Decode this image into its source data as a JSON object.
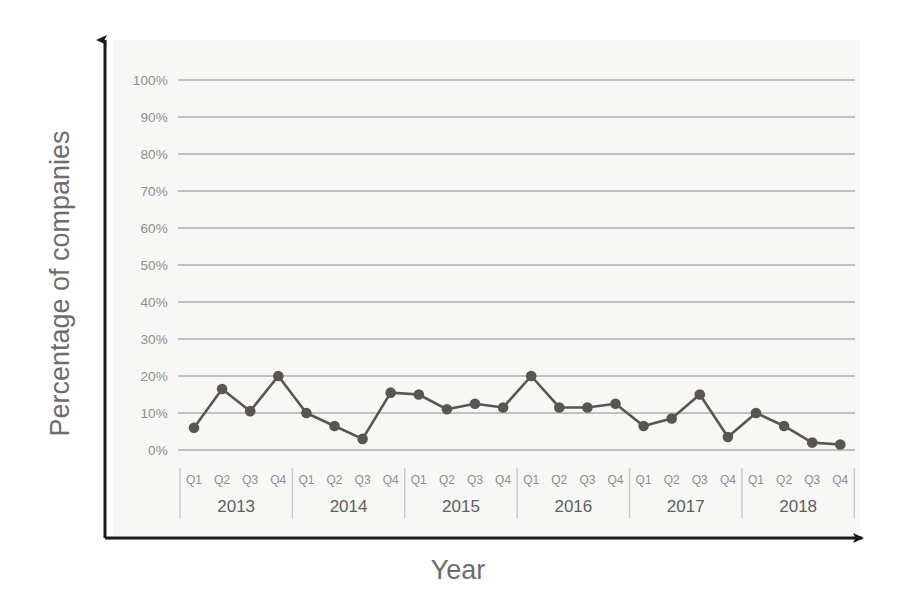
{
  "chart_data": {
    "type": "line",
    "title": "",
    "xlabel": "Year",
    "ylabel": "Percentage of companies",
    "ylim": [
      0,
      100
    ],
    "ytick_labels": [
      "0%",
      "10%",
      "20%",
      "30%",
      "40%",
      "50%",
      "60%",
      "70%",
      "80%",
      "90%",
      "100%"
    ],
    "ytick_values": [
      0,
      10,
      20,
      30,
      40,
      50,
      60,
      70,
      80,
      90,
      100
    ],
    "grid": true,
    "legend": "none",
    "quarter_labels": [
      "Q1",
      "Q2",
      "Q3",
      "Q4"
    ],
    "years": [
      "2013",
      "2014",
      "2015",
      "2016",
      "2017",
      "2018"
    ],
    "categories": [
      "Q1 2013",
      "Q2 2013",
      "Q3 2013",
      "Q4 2013",
      "Q1 2014",
      "Q2 2014",
      "Q3 2014",
      "Q4 2014",
      "Q1 2015",
      "Q2 2015",
      "Q3 2015",
      "Q4 2015",
      "Q1 2016",
      "Q2 2016",
      "Q3 2016",
      "Q4 2016",
      "Q1 2017",
      "Q2 2017",
      "Q3 2017",
      "Q4 2017",
      "Q1 2018",
      "Q2 2018",
      "Q3 2018",
      "Q4 2018"
    ],
    "values": [
      6,
      16.5,
      10.5,
      20,
      10,
      6.5,
      3,
      15.5,
      15,
      11,
      12.5,
      11.5,
      20,
      11.5,
      11.5,
      12.5,
      6.5,
      8.5,
      15,
      3.5,
      10,
      6.5,
      2,
      1.5
    ],
    "series": [
      {
        "name": "Percentage of companies",
        "values": [
          6,
          16.5,
          10.5,
          20,
          10,
          6.5,
          3,
          15.5,
          15,
          11,
          12.5,
          11.5,
          20,
          11.5,
          11.5,
          12.5,
          6.5,
          8.5,
          15,
          3.5,
          10,
          6.5,
          2,
          1.5
        ]
      }
    ],
    "colors": {
      "line": "#5a5550",
      "marker": "#5a5550",
      "gridline": "#8a8a8a",
      "axis": "#1a1a1a",
      "plot_background": "#f7f7f6",
      "tick_text": "#8d8d8d",
      "year_text": "#5e5e5e",
      "axis_title_text": "#6d6d6d",
      "separator": "#c9c9c9"
    }
  }
}
